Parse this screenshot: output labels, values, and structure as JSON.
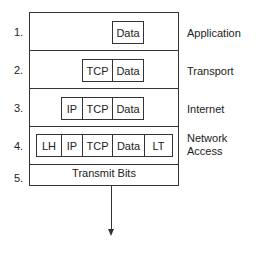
{
  "diagram": {
    "rows": [
      {
        "num": "1.",
        "label": "Application",
        "cells": [
          "Data"
        ]
      },
      {
        "num": "2.",
        "label": "Transport",
        "cells": [
          "TCP",
          "Data"
        ]
      },
      {
        "num": "3.",
        "label": "Internet",
        "cells": [
          "IP",
          "TCP",
          "Data"
        ]
      },
      {
        "num": "4.",
        "label_line1": "Network",
        "label_line2": "Access",
        "cells": [
          "LH",
          "IP",
          "TCP",
          "Data",
          "LT"
        ]
      },
      {
        "num": "5.",
        "text": "Transmit Bits"
      }
    ]
  }
}
